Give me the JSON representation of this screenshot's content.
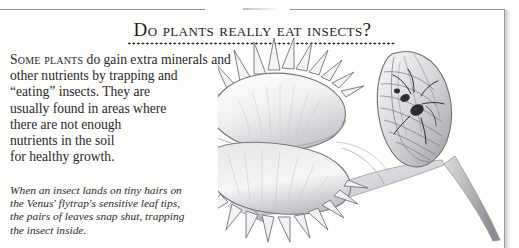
{
  "page": {
    "heading": "Do plants really eat insects?",
    "heading_plain": "DO PLANTS REALLY EAT INSECTS?"
  },
  "body": {
    "lead_smallcaps": "Some plants",
    "lines": [
      "do gain extra minerals and",
      "other nutrients by trapping and",
      "“eating” insects. They are",
      "usually found in areas where",
      "there are not enough",
      "nutrients in the soil",
      "for healthy growth."
    ],
    "full_text": "Some plants do gain extra minerals and other nutrients by trapping and “eating” insects. They are usually found in areas where there are not enough nutrients in the soil for healthy growth."
  },
  "caption": {
    "lines": [
      "When an insect lands on tiny hairs on",
      "the Venus' flytrap's sensitive leaf tips,",
      "the pairs of leaves snap shut, trapping",
      "the insect inside."
    ],
    "full_text": "When an insect lands on tiny hairs on the Venus' flytrap's sensitive leaf tips, the pairs of leaves snap shut, trapping the insect inside."
  },
  "illustration": {
    "subject": "venus-flytrap-illustration",
    "elements": [
      "open-trap-with-teeth",
      "closed-trap-with-insect",
      "leaf-blade",
      "stem"
    ],
    "medium": "pencil-drawing"
  },
  "colors": {
    "paper": "#fdfdfc",
    "text": "#262628",
    "heading": "#1d1d1f",
    "rule": "#8e8e90",
    "drawing_dark": "#6d6d72",
    "drawing_mid": "#a8a8ad",
    "drawing_light": "#dcdcdf"
  }
}
